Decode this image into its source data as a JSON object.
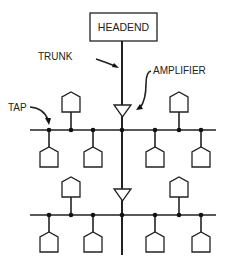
{
  "diagram": {
    "labels": {
      "headend": "HEADEND",
      "trunk": "TRUNK",
      "amplifier": "AMPLIFIER",
      "tap": "TAP"
    },
    "colors": {
      "line": "#222222",
      "background": "#ffffff"
    },
    "nodes": {
      "headend": {
        "x": 90,
        "y": 13,
        "w": 67,
        "h": 28
      },
      "trunk_x": 122,
      "amplifiers": [
        {
          "y_top": 105
        },
        {
          "y_top": 189
        }
      ],
      "branches": [
        {
          "bus_y": 130,
          "taps_x": [
            49,
            71,
            93,
            122,
            155,
            179,
            201
          ],
          "houses_above_x": [
            71,
            179
          ],
          "houses_below_x": [
            49,
            93,
            155,
            201
          ]
        },
        {
          "bus_y": 215,
          "taps_x": [
            49,
            71,
            93,
            122,
            155,
            179,
            201
          ],
          "houses_above_x": [
            71,
            179
          ],
          "houses_below_x": [
            49,
            93,
            155,
            201
          ]
        }
      ]
    }
  }
}
